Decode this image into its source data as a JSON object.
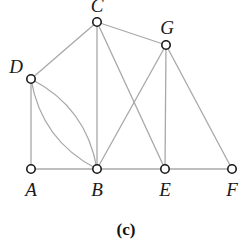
{
  "figure": {
    "caption": "(c)",
    "nodes": [
      {
        "id": "A",
        "label": "A",
        "x": 31,
        "y": 169,
        "lx": 31,
        "ly": 196
      },
      {
        "id": "B",
        "label": "B",
        "x": 97,
        "y": 169,
        "lx": 97,
        "ly": 196
      },
      {
        "id": "E",
        "label": "E",
        "x": 165,
        "y": 169,
        "lx": 165,
        "ly": 196
      },
      {
        "id": "F",
        "label": "F",
        "x": 232,
        "y": 169,
        "lx": 232,
        "ly": 196
      },
      {
        "id": "D",
        "label": "D",
        "x": 31,
        "y": 79,
        "lx": 16,
        "ly": 73
      },
      {
        "id": "C",
        "label": "C",
        "x": 97,
        "y": 22,
        "lx": 97,
        "ly": 12
      },
      {
        "id": "G",
        "label": "G",
        "x": 166,
        "y": 45,
        "lx": 167,
        "ly": 34
      }
    ],
    "edges": [
      {
        "from": "A",
        "to": "B",
        "type": "straight"
      },
      {
        "from": "B",
        "to": "E",
        "type": "straight"
      },
      {
        "from": "E",
        "to": "F",
        "type": "straight"
      },
      {
        "from": "D",
        "to": "A",
        "type": "straight"
      },
      {
        "from": "D",
        "to": "C",
        "type": "straight"
      },
      {
        "from": "D",
        "to": "B",
        "type": "curve",
        "bend": 14
      },
      {
        "from": "D",
        "to": "B",
        "type": "curve",
        "bend": -14
      },
      {
        "from": "C",
        "to": "B",
        "type": "straight"
      },
      {
        "from": "C",
        "to": "E",
        "type": "straight"
      },
      {
        "from": "C",
        "to": "G",
        "type": "straight"
      },
      {
        "from": "G",
        "to": "B",
        "type": "straight"
      },
      {
        "from": "G",
        "to": "E",
        "type": "straight"
      },
      {
        "from": "G",
        "to": "F",
        "type": "straight"
      }
    ],
    "colors": {
      "edge": "#a8a8a8",
      "node_stroke": "#1a1a1a",
      "background": "#ffffff"
    }
  }
}
